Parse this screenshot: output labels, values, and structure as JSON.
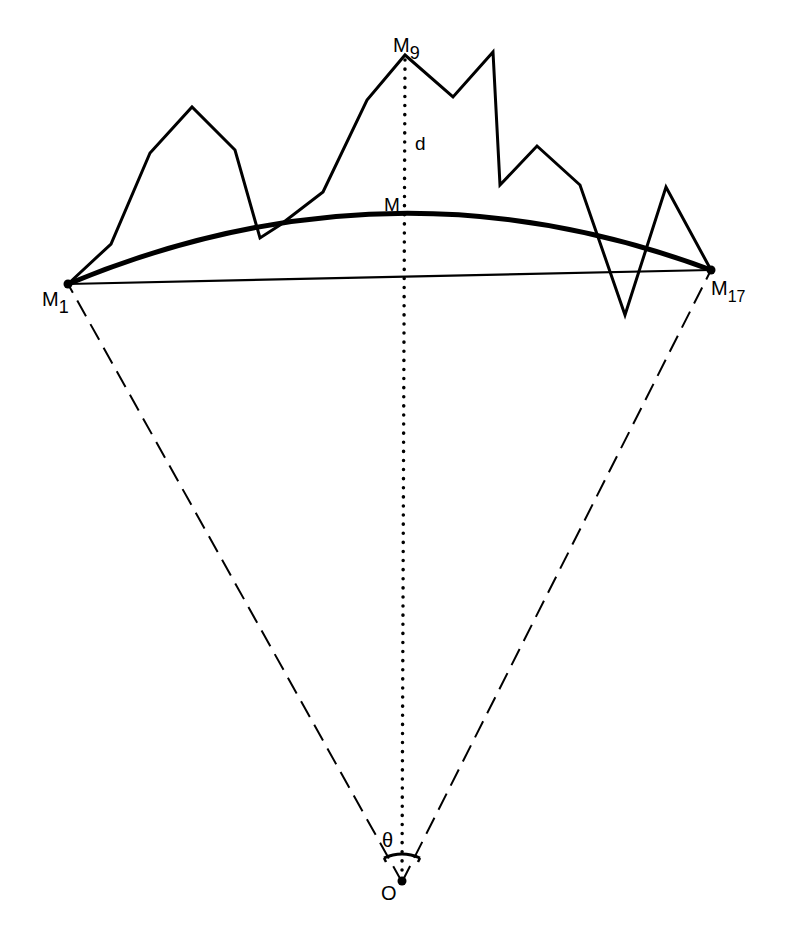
{
  "diagram": {
    "type": "geometric-construction",
    "colors": {
      "stroke": "#000000",
      "background": "#ffffff"
    },
    "points": {
      "M1": [
        68,
        284
      ],
      "M9": [
        405,
        55
      ],
      "M17": [
        711,
        270
      ],
      "M": [
        405,
        218
      ],
      "O": [
        402,
        882
      ]
    },
    "polyline": [
      [
        68,
        284
      ],
      [
        111,
        244
      ],
      [
        150,
        153
      ],
      [
        192,
        107
      ],
      [
        235,
        150
      ],
      [
        260,
        238
      ],
      [
        280,
        225
      ],
      [
        323,
        192
      ],
      [
        367,
        100
      ],
      [
        405,
        55
      ],
      [
        453,
        97
      ],
      [
        493,
        52
      ],
      [
        500,
        185
      ],
      [
        537,
        146
      ],
      [
        580,
        185
      ],
      [
        625,
        315
      ],
      [
        666,
        187
      ],
      [
        711,
        270
      ]
    ],
    "labels": {
      "m1_main": "M",
      "m1_sub": "1",
      "m9_main": "M",
      "m9_sub": "9",
      "m17_main": "M",
      "m17_sub": "17",
      "m": "M",
      "d": "d",
      "theta": "θ",
      "o": "O"
    }
  }
}
